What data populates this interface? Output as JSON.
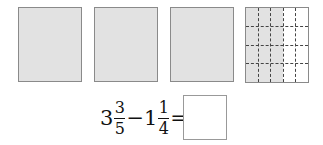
{
  "figure": {
    "boxes": [
      {
        "id": 1,
        "fill": "full",
        "color": "#e2e2e2"
      },
      {
        "id": 2,
        "fill": "full",
        "color": "#e2e2e2"
      },
      {
        "id": 3,
        "fill": "full",
        "color": "#e2e2e2"
      },
      {
        "id": 4,
        "fill": "partial",
        "columns": 5,
        "rows": 4,
        "shaded_columns": 3,
        "color": "#e2e2e2"
      }
    ]
  },
  "equation": {
    "whole1": "3",
    "num1": "3",
    "den1": "5",
    "operator": "−",
    "whole2": "1",
    "num2": "1",
    "den2": "4",
    "equals": "=",
    "answer": ""
  }
}
